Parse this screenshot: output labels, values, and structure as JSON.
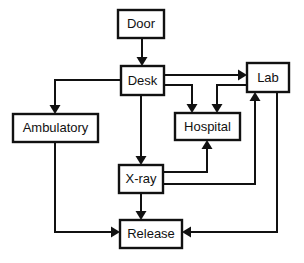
{
  "diagram": {
    "type": "flowchart",
    "background_color": "#ffffff",
    "line_color": "#111111",
    "box_fill": "#ffffff",
    "nodes": [
      {
        "id": "door",
        "label": "Door",
        "x": 118,
        "y": 10,
        "w": 46,
        "h": 28
      },
      {
        "id": "desk",
        "label": "Desk",
        "x": 121,
        "y": 66,
        "w": 43,
        "h": 29
      },
      {
        "id": "lab",
        "label": "Lab",
        "x": 247,
        "y": 63,
        "w": 42,
        "h": 29
      },
      {
        "id": "ambulatory",
        "label": "Ambulatory",
        "x": 13,
        "y": 114,
        "w": 85,
        "h": 28
      },
      {
        "id": "hospital",
        "label": "Hospital",
        "x": 175,
        "y": 113,
        "w": 65,
        "h": 27
      },
      {
        "id": "xray",
        "label": "X-ray",
        "x": 119,
        "y": 165,
        "w": 44,
        "h": 28
      },
      {
        "id": "release",
        "label": "Release",
        "x": 120,
        "y": 220,
        "w": 62,
        "h": 28
      }
    ],
    "edges": [
      {
        "id": "door-to-desk",
        "from": "Door",
        "to": "Desk",
        "points": "142,38 142,60",
        "arrow_at": "142,66",
        "arrow_dir": "down"
      },
      {
        "id": "desk-to-lab",
        "from": "Desk",
        "to": "Lab",
        "points": "164,75 239,75",
        "arrow_at": "247,75",
        "arrow_dir": "right"
      },
      {
        "id": "desk-to-ambulatory",
        "from": "Desk",
        "to": "Ambulatory",
        "points": "121,80 55,80 55,107",
        "arrow_at": "55,114",
        "arrow_dir": "down"
      },
      {
        "id": "desk-to-hospital",
        "from": "Desk",
        "to": "Hospital",
        "points": "164,85 192,85 192,106",
        "arrow_at": "192,113",
        "arrow_dir": "down"
      },
      {
        "id": "lab-to-hospital",
        "from": "Lab",
        "to": "Hospital",
        "points": "247,85 217,85 217,106",
        "arrow_at": "217,113",
        "arrow_dir": "down"
      },
      {
        "id": "desk-to-xray",
        "from": "Desk",
        "to": "X-ray",
        "points": "141,95 141,158",
        "arrow_at": "141,165",
        "arrow_dir": "down"
      },
      {
        "id": "xray-to-hospital",
        "from": "X-ray",
        "to": "Hospital",
        "points": "163,172 207,172 207,148",
        "arrow_at": "207,140",
        "arrow_dir": "up"
      },
      {
        "id": "xray-to-lab",
        "from": "X-ray",
        "to": "Lab",
        "points": "163,184 255,184 255,100",
        "arrow_at": "255,92",
        "arrow_dir": "up"
      },
      {
        "id": "xray-to-release",
        "from": "X-ray",
        "to": "Release",
        "points": "141,193 141,213",
        "arrow_at": "141,220",
        "arrow_dir": "down"
      },
      {
        "id": "ambulatory-to-release",
        "from": "Ambulatory",
        "to": "Release",
        "points": "55,142 55,232 112,232",
        "arrow_at": "120,232",
        "arrow_dir": "right"
      },
      {
        "id": "lab-to-release",
        "from": "Lab",
        "to": "Release",
        "points": "277,92 277,232 190,232",
        "arrow_at": "182,232",
        "arrow_dir": "left"
      }
    ]
  }
}
